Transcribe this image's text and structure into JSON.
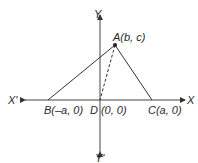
{
  "diagram": {
    "axes": {
      "x_positive_label": "X",
      "x_negative_label": "X'",
      "y_positive_label": "Y",
      "y_negative_label": "Y'"
    },
    "points": {
      "A": {
        "name": "A",
        "coords": "(b, c)"
      },
      "B": {
        "name": "B",
        "coords": "(–a, 0)"
      },
      "C": {
        "name": "C",
        "coords": "(a, 0)"
      },
      "D": {
        "name": "D",
        "coords": "(0, 0)"
      }
    },
    "segments": [
      {
        "from": "A",
        "to": "B",
        "style": "solid"
      },
      {
        "from": "A",
        "to": "C",
        "style": "solid"
      },
      {
        "from": "A",
        "to": "D",
        "style": "dashed"
      }
    ],
    "colors": {
      "line": "#333333",
      "text": "#2a2a2a"
    }
  }
}
